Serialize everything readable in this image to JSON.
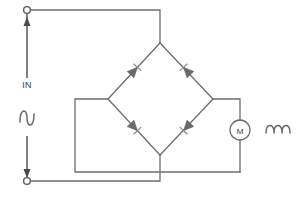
{
  "diagram": {
    "type": "circuit-schematic",
    "background_color": "#ffffff",
    "wire_color": "#6e6e6e",
    "symbol_color": "#6a6a6a",
    "label_color": "#3c3c3c"
  },
  "labels": {
    "input": "IN",
    "motor": "M"
  },
  "symbols": {
    "ac_source_icon": "sine-wave-icon",
    "motor_icon": "motor-icon",
    "coil_icon": "coil-icon",
    "terminal_icon": "terminal-node-icon",
    "diode_icon": "diode-icon"
  },
  "terminals": [
    {
      "name": "input-terminal-top",
      "x": 27,
      "y": 10
    },
    {
      "name": "input-terminal-bottom",
      "x": 27,
      "y": 181
    }
  ],
  "nodes": {
    "bridge_top": {
      "x": 160,
      "y": 43
    },
    "bridge_left": {
      "x": 108,
      "y": 99
    },
    "bridge_right": {
      "x": 213,
      "y": 99
    },
    "bridge_bottom": {
      "x": 160,
      "y": 155
    }
  },
  "diodes": [
    {
      "name": "diode-upper-left",
      "from": "bridge_left",
      "to": "bridge_top",
      "direction": "up-right"
    },
    {
      "name": "diode-upper-right",
      "from": "bridge_right",
      "to": "bridge_top",
      "direction": "up-left"
    },
    {
      "name": "diode-lower-left",
      "from": "bridge_left",
      "to": "bridge_bottom",
      "direction": "down-right"
    },
    {
      "name": "diode-lower-right",
      "from": "bridge_right",
      "to": "bridge_bottom",
      "direction": "down-left"
    }
  ],
  "components": [
    {
      "name": "ac-input-source",
      "label": "IN",
      "icon": "sine-wave-icon"
    },
    {
      "name": "motor-load",
      "label": "M",
      "icon": "motor-icon"
    },
    {
      "name": "coil-inductor",
      "label": "",
      "icon": "coil-icon"
    }
  ]
}
